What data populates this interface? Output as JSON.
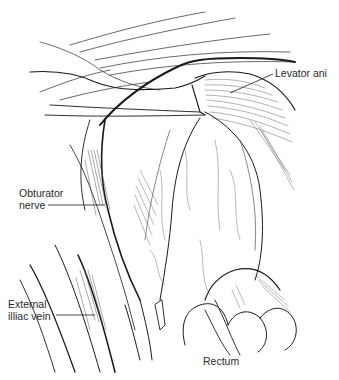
{
  "figure": {
    "type": "anatomical line illustration",
    "colors": {
      "ink": "#1a1a1a",
      "hatch": "#555555",
      "background": "#ffffff"
    }
  },
  "labels": [
    {
      "id": "levator-ani",
      "line1": "Levator ani",
      "line2": ""
    },
    {
      "id": "obturator-nerve",
      "line1": "Obturator",
      "line2": "nerve"
    },
    {
      "id": "external-iliac-vein",
      "line1": "External",
      "line2": "illiac vein"
    },
    {
      "id": "rectum",
      "line1": "Rectum",
      "line2": ""
    }
  ]
}
